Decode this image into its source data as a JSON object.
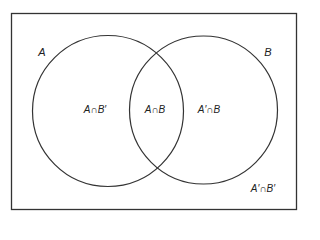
{
  "diagram": {
    "type": "venn",
    "universe": {
      "label": ""
    },
    "sets": [
      {
        "name": "A",
        "label": "A"
      },
      {
        "name": "B",
        "label": "B"
      }
    ],
    "regions": {
      "a_not_b": "A∩B′",
      "a_and_b": "A∩B",
      "not_a_and_b": "A′∩B",
      "not_a_not_b": "A′∩B′"
    },
    "colors": {
      "stroke": "#333333",
      "background": "#ffffff",
      "text": "#222222"
    }
  }
}
